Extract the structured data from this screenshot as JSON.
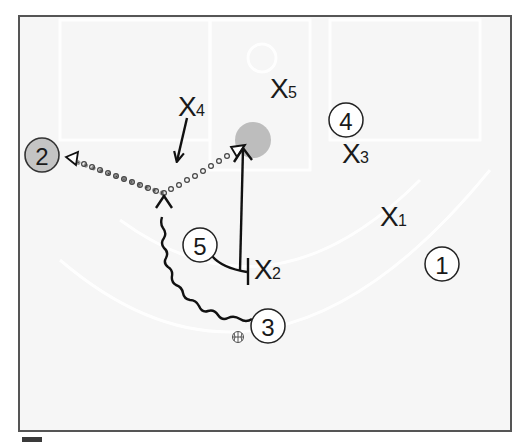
{
  "diagram": {
    "type": "basketball-play",
    "court": {
      "background": "#f7f7f7",
      "border_color": "#555555",
      "court_line_color": "#ffffff"
    },
    "offense": [
      {
        "id": "1",
        "label": "1",
        "x": 442,
        "y": 264,
        "filled": false
      },
      {
        "id": "2",
        "label": "2",
        "x": 42,
        "y": 155,
        "filled": true
      },
      {
        "id": "3",
        "label": "3",
        "x": 268,
        "y": 326,
        "filled": false,
        "has_ball": true
      },
      {
        "id": "4",
        "label": "4",
        "x": 346,
        "y": 120,
        "filled": false
      },
      {
        "id": "5",
        "label": "5",
        "x": 200,
        "y": 245,
        "filled": false
      }
    ],
    "defense": [
      {
        "id": "X1",
        "main": "X",
        "sub": "1",
        "x": 380,
        "y": 226
      },
      {
        "id": "X2",
        "main": "X",
        "sub": "2",
        "x": 256,
        "y": 278
      },
      {
        "id": "X3",
        "main": "X",
        "sub": "3",
        "x": 342,
        "y": 163
      },
      {
        "id": "X4",
        "main": "X",
        "sub": "4",
        "x": 178,
        "y": 116
      },
      {
        "id": "X5",
        "main": "X",
        "sub": "5",
        "x": 270,
        "y": 98
      }
    ],
    "target_spot": {
      "x": 253,
      "y": 140,
      "color": "#bdbdbd"
    },
    "player2_fill": "#c4c4c4",
    "actions": [
      {
        "type": "pass",
        "from": "3-dribble-end",
        "to": "2",
        "style": "dotted"
      },
      {
        "type": "pass",
        "from": "3-dribble-end",
        "to": "target-spot",
        "style": "dotted"
      },
      {
        "type": "dribble",
        "player": "3",
        "style": "wavy"
      },
      {
        "type": "screen",
        "player": "5",
        "on": "X2"
      },
      {
        "type": "cut",
        "player": "5",
        "to": "target-spot"
      },
      {
        "type": "move",
        "player": "X4",
        "direction": "down"
      }
    ]
  }
}
